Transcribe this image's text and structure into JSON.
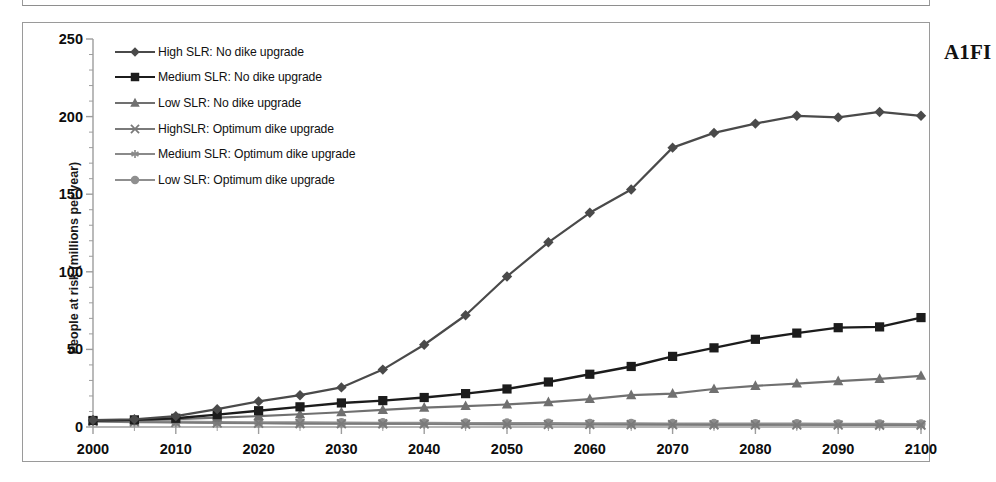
{
  "figure": {
    "scenario_label": "A1FI"
  },
  "chart_data": {
    "type": "line",
    "title": "",
    "subtitle": "",
    "xlabel": "",
    "ylabel": "People at risk (millions per year)",
    "xlim": [
      2000,
      2100
    ],
    "ylim": [
      0,
      250
    ],
    "y_major_step": 50,
    "y_minor_step": 10,
    "x_major_step": 10,
    "x_minor_step": 5,
    "grid": false,
    "legend_position": "upper-left-inside",
    "x": [
      2000,
      2005,
      2010,
      2015,
      2020,
      2025,
      2030,
      2035,
      2040,
      2045,
      2050,
      2055,
      2060,
      2065,
      2070,
      2075,
      2080,
      2085,
      2090,
      2095,
      2100
    ],
    "xtick_labels": [
      "2000",
      "2010",
      "2020",
      "2030",
      "2040",
      "2050",
      "2060",
      "2070",
      "2080",
      "2090",
      "2100"
    ],
    "xtick_values": [
      2000,
      2010,
      2020,
      2030,
      2040,
      2050,
      2060,
      2070,
      2080,
      2090,
      2100
    ],
    "ytick_labels": [
      "0",
      "50",
      "100",
      "150",
      "200",
      "250"
    ],
    "ytick_values": [
      0,
      50,
      100,
      150,
      200,
      250
    ],
    "series": [
      {
        "name": "High SLR: No dike upgrade",
        "marker": "diamond",
        "color": "#4a4a4a",
        "line_width": 2.2,
        "values": [
          4.5,
          5.0,
          7.0,
          11.5,
          16.5,
          20.5,
          25.5,
          37.0,
          53.0,
          72.0,
          97.0,
          119.0,
          138.0,
          153.0,
          180.0,
          189.5,
          195.5,
          200.5,
          199.5,
          203.0,
          200.5
        ]
      },
      {
        "name": "Medium SLR: No dike upgrade",
        "marker": "square",
        "color": "#1c1c1c",
        "line_width": 2.4,
        "values": [
          4.2,
          4.6,
          5.6,
          8.0,
          10.5,
          13.0,
          15.5,
          17.0,
          19.0,
          21.5,
          24.5,
          29.0,
          34.0,
          39.0,
          45.5,
          51.0,
          56.5,
          60.5,
          64.0,
          64.5,
          70.5
        ]
      },
      {
        "name": "Low SLR: No dike upgrade",
        "marker": "triangle",
        "color": "#707070",
        "line_width": 2.2,
        "values": [
          4.0,
          4.3,
          5.0,
          6.0,
          7.0,
          8.2,
          9.5,
          11.0,
          12.5,
          13.5,
          14.5,
          16.0,
          18.0,
          20.5,
          21.5,
          24.5,
          26.5,
          28.0,
          29.5,
          31.0,
          33.0
        ]
      },
      {
        "name": "HighSLR: Optimum dike upgrade",
        "marker": "x",
        "color": "#7a7a7a",
        "line_width": 1.6,
        "values": [
          3.6,
          3.2,
          2.9,
          2.6,
          2.4,
          2.2,
          2.1,
          2.0,
          1.9,
          1.8,
          1.7,
          1.6,
          1.6,
          1.5,
          1.5,
          1.4,
          1.4,
          1.3,
          1.3,
          1.2,
          1.2
        ]
      },
      {
        "name": "Medium SLR:  Optimum dike upgrade",
        "marker": "asterisk",
        "color": "#8a8a8a",
        "line_width": 1.6,
        "values": [
          3.4,
          3.0,
          2.7,
          2.5,
          2.3,
          2.1,
          2.0,
          1.9,
          1.8,
          1.7,
          1.6,
          1.6,
          1.5,
          1.5,
          1.4,
          1.4,
          1.3,
          1.3,
          1.2,
          1.2,
          1.1
        ]
      },
      {
        "name": "Low SLR: Optimum dike upgrade",
        "marker": "circle",
        "color": "#8f8f8f",
        "line_width": 2.0,
        "values": [
          4.0,
          3.7,
          3.5,
          3.3,
          3.1,
          3.0,
          2.9,
          2.8,
          2.7,
          2.6,
          2.6,
          2.5,
          2.4,
          2.4,
          2.3,
          2.3,
          2.2,
          2.2,
          2.1,
          2.1,
          2.0
        ]
      }
    ]
  }
}
